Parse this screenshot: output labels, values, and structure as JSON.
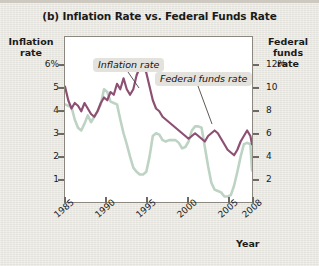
{
  "figure": {
    "title": "(b) Inflation Rate vs. Federal Funds Rate",
    "background_color": "#e9e7e1",
    "plot_background_color": "#ffffff",
    "frame_color": "#8c8880"
  },
  "axes": {
    "left_title": "Inflation\nrate",
    "left_title_line1": "Inflation",
    "left_title_line2": "rate",
    "right_title_line1": "Federal",
    "right_title_line2": "funds",
    "right_title_line3": "rate",
    "x_title": "Year",
    "left_ticks": [
      "6%",
      "5",
      "4",
      "3",
      "2",
      "1"
    ],
    "right_ticks": [
      "12%",
      "10",
      "8",
      "6",
      "4",
      "2"
    ],
    "x_ticks": [
      "1985",
      "1990",
      "1995",
      "2000",
      "2005",
      "2008"
    ]
  },
  "annotations": {
    "inflation_label": "Inflation rate",
    "fedfunds_label": "Federal funds rate"
  },
  "chart_data": {
    "type": "line",
    "title": "(b) Inflation Rate vs. Federal Funds Rate",
    "xlabel": "Year",
    "ylabel": "Inflation rate",
    "y2label": "Federal funds rate",
    "xlim": [
      1985,
      2008
    ],
    "ylim": [
      0.5,
      6.5
    ],
    "y2lim": [
      1.0,
      13.0
    ],
    "grid": false,
    "legend": "annotated-inline",
    "x_tick_values": [
      1985,
      1990,
      1995,
      2000,
      2005,
      2008
    ],
    "left_tick_values": [
      6,
      5,
      4,
      3,
      2,
      1
    ],
    "right_tick_values": [
      12,
      10,
      8,
      6,
      4,
      2
    ],
    "series": [
      {
        "name": "Inflation rate",
        "axis": "left",
        "color": "#8d4f72",
        "units": "percent",
        "x": [
          1985.0,
          1985.4,
          1985.8,
          1986.2,
          1986.6,
          1987.0,
          1987.4,
          1987.8,
          1988.2,
          1988.6,
          1989.0,
          1989.4,
          1989.8,
          1990.2,
          1990.6,
          1991.0,
          1991.4,
          1991.8,
          1992.2,
          1992.6,
          1993.0,
          1993.4,
          1993.8,
          1994.2,
          1994.6,
          1995.0,
          1995.4,
          1995.8,
          1996.2,
          1996.6,
          1997.0,
          1997.4,
          1997.8,
          1998.2,
          1998.6,
          1999.0,
          1999.4,
          1999.8,
          2000.2,
          2000.6,
          2001.0,
          2001.4,
          2001.8,
          2002.2,
          2002.6,
          2003.0,
          2003.4,
          2003.8,
          2004.2,
          2004.6,
          2005.0,
          2005.4,
          2005.8,
          2006.2,
          2006.6,
          2007.0,
          2007.4,
          2007.8,
          2008.0
        ],
        "y": [
          4.7,
          4.2,
          3.9,
          4.1,
          4.0,
          3.8,
          4.1,
          3.9,
          3.7,
          3.6,
          3.8,
          4.1,
          4.3,
          4.2,
          4.5,
          4.4,
          4.8,
          4.6,
          5.0,
          4.6,
          4.4,
          4.6,
          5.1,
          5.4,
          5.5,
          5.2,
          4.7,
          4.2,
          3.9,
          3.8,
          3.6,
          3.5,
          3.4,
          3.3,
          3.2,
          3.1,
          3.0,
          2.9,
          2.8,
          2.9,
          3.0,
          2.9,
          2.8,
          2.7,
          2.9,
          3.0,
          3.1,
          3.0,
          2.8,
          2.6,
          2.4,
          2.3,
          2.2,
          2.4,
          2.7,
          2.9,
          3.1,
          2.9,
          2.6
        ]
      },
      {
        "name": "Federal funds rate",
        "axis": "right",
        "color": "#bdd3c4",
        "units": "percent",
        "x": [
          1985.0,
          1985.4,
          1985.8,
          1986.2,
          1986.6,
          1987.0,
          1987.4,
          1987.8,
          1988.2,
          1988.6,
          1989.0,
          1989.4,
          1989.8,
          1990.2,
          1990.6,
          1991.0,
          1991.4,
          1991.8,
          1992.2,
          1992.6,
          1993.0,
          1993.4,
          1993.8,
          1994.2,
          1994.6,
          1995.0,
          1995.4,
          1995.8,
          1996.2,
          1996.6,
          1997.0,
          1997.4,
          1997.8,
          1998.2,
          1998.6,
          1999.0,
          1999.4,
          1999.8,
          2000.2,
          2000.6,
          2001.0,
          2001.4,
          2001.8,
          2002.2,
          2002.6,
          2003.0,
          2003.4,
          2003.8,
          2004.2,
          2004.6,
          2005.0,
          2005.4,
          2005.8,
          2006.2,
          2006.6,
          2007.0,
          2007.4,
          2007.8,
          2008.0
        ],
        "y": [
          8.1,
          8.0,
          7.9,
          7.0,
          6.4,
          6.2,
          6.7,
          7.3,
          6.8,
          7.2,
          7.6,
          8.1,
          9.2,
          9.0,
          8.3,
          8.2,
          8.1,
          7.0,
          6.0,
          5.2,
          4.3,
          3.5,
          3.2,
          3.0,
          3.0,
          3.2,
          4.3,
          5.8,
          6.0,
          5.9,
          5.5,
          5.4,
          5.5,
          5.5,
          5.5,
          5.3,
          4.9,
          5.0,
          5.4,
          6.2,
          6.5,
          6.5,
          6.4,
          5.0,
          3.6,
          2.4,
          1.9,
          1.8,
          1.7,
          1.4,
          1.4,
          1.5,
          2.2,
          3.2,
          4.3,
          5.2,
          5.3,
          5.2,
          3.3
        ]
      }
    ]
  }
}
